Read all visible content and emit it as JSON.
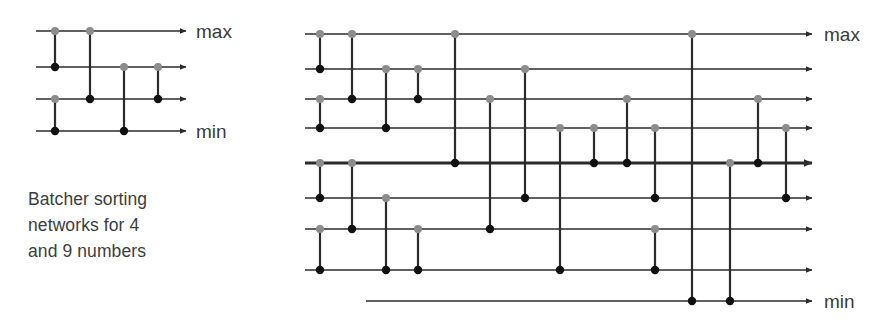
{
  "figure": {
    "caption": "Batcher sorting networks for 4 and 9 numbers",
    "caption_lines": [
      "Batcher sorting",
      "networks for 4",
      "and 9 numbers"
    ],
    "colors": {
      "wire": "#2b2b2b",
      "comparator_line": "#2b2b2b",
      "dot_top": "#8c8c8c",
      "dot_bottom": "#111111",
      "text": "#3d3d3d",
      "background": "#ffffff"
    },
    "labels": {
      "max": "max",
      "min": "min"
    }
  },
  "chart_data": {
    "type": "diagram",
    "title": "Batcher sorting networks for 4 and 9 numbers",
    "networks": [
      {
        "name": "batcher-network-4",
        "n_wires": 4,
        "wire_count_label": "4",
        "x_start": 36,
        "x_end": 186,
        "wire_y": [
          31,
          67,
          99,
          131
        ],
        "top_label": "max",
        "bottom_label": "min",
        "top_label_pos": [
          196,
          38
        ],
        "bottom_label_pos": [
          196,
          138
        ],
        "comparators": [
          {
            "x": 55,
            "from_wire": 0,
            "to_wire": 1
          },
          {
            "x": 55,
            "from_wire": 2,
            "to_wire": 3
          },
          {
            "x": 90,
            "from_wire": 0,
            "to_wire": 2
          },
          {
            "x": 124,
            "from_wire": 1,
            "to_wire": 3
          },
          {
            "x": 158,
            "from_wire": 1,
            "to_wire": 2
          }
        ]
      },
      {
        "name": "batcher-network-9",
        "n_wires": 9,
        "wire_count_label": "9",
        "x_start": 305,
        "x_end": 812,
        "wire_y": [
          34,
          69,
          99,
          128,
          163,
          198,
          229,
          270,
          301
        ],
        "thick_wire_index": 4,
        "short_wire_index": 8,
        "short_wire_x_start": 366,
        "top_label": "max",
        "bottom_label": "min",
        "top_label_pos": [
          824,
          41
        ],
        "bottom_label_pos": [
          824,
          308
        ],
        "comparators": [
          {
            "x": 320,
            "from_wire": 0,
            "to_wire": 1
          },
          {
            "x": 320,
            "from_wire": 2,
            "to_wire": 3
          },
          {
            "x": 320,
            "from_wire": 4,
            "to_wire": 5
          },
          {
            "x": 320,
            "from_wire": 6,
            "to_wire": 7
          },
          {
            "x": 352,
            "from_wire": 0,
            "to_wire": 2
          },
          {
            "x": 352,
            "from_wire": 4,
            "to_wire": 6
          },
          {
            "x": 386,
            "from_wire": 1,
            "to_wire": 3
          },
          {
            "x": 386,
            "from_wire": 5,
            "to_wire": 7
          },
          {
            "x": 418,
            "from_wire": 1,
            "to_wire": 2
          },
          {
            "x": 418,
            "from_wire": 6,
            "to_wire": 7
          },
          {
            "x": 455,
            "from_wire": 0,
            "to_wire": 4
          },
          {
            "x": 490,
            "from_wire": 2,
            "to_wire": 6
          },
          {
            "x": 525,
            "from_wire": 1,
            "to_wire": 5
          },
          {
            "x": 560,
            "from_wire": 3,
            "to_wire": 7
          },
          {
            "x": 594,
            "from_wire": 3,
            "to_wire": 4
          },
          {
            "x": 627,
            "from_wire": 2,
            "to_wire": 4
          },
          {
            "x": 655,
            "from_wire": 3,
            "to_wire": 5
          },
          {
            "x": 655,
            "from_wire": 6,
            "to_wire": 7
          },
          {
            "x": 692,
            "from_wire": 0,
            "to_wire": 8
          },
          {
            "x": 730,
            "from_wire": 4,
            "to_wire": 8
          },
          {
            "x": 758,
            "from_wire": 2,
            "to_wire": 4
          },
          {
            "x": 786,
            "from_wire": 3,
            "to_wire": 5
          }
        ]
      }
    ]
  }
}
